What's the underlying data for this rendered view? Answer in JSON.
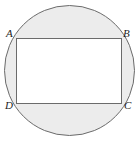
{
  "figure": {
    "width": 138,
    "height": 144,
    "background_color": "#ffffff",
    "shapes": {
      "circle": {
        "name": "circumscribed-circle",
        "center_x": 69.5,
        "center_y": 70.5,
        "radius": 65,
        "fill_color": "#ececec",
        "stroke_color": "#6b6b6b",
        "stroke_width": 1
      },
      "rectangle": {
        "name": "inscribed-rectangle",
        "x": 16.5,
        "y": 38.5,
        "width": 105,
        "height": 65,
        "fill_color": "#ffffff",
        "stroke_color": "#6b6b6b",
        "stroke_width": 1
      }
    },
    "labels": [
      {
        "id": "a",
        "text": "A",
        "vertex": "top-left",
        "x": 6,
        "y": 28
      },
      {
        "id": "b",
        "text": "B",
        "vertex": "top-right",
        "x": 123,
        "y": 28
      },
      {
        "id": "c",
        "text": "C",
        "vertex": "bottom-right",
        "x": 124,
        "y": 100
      },
      {
        "id": "d",
        "text": "D",
        "vertex": "bottom-left",
        "x": 5,
        "y": 100
      }
    ]
  }
}
